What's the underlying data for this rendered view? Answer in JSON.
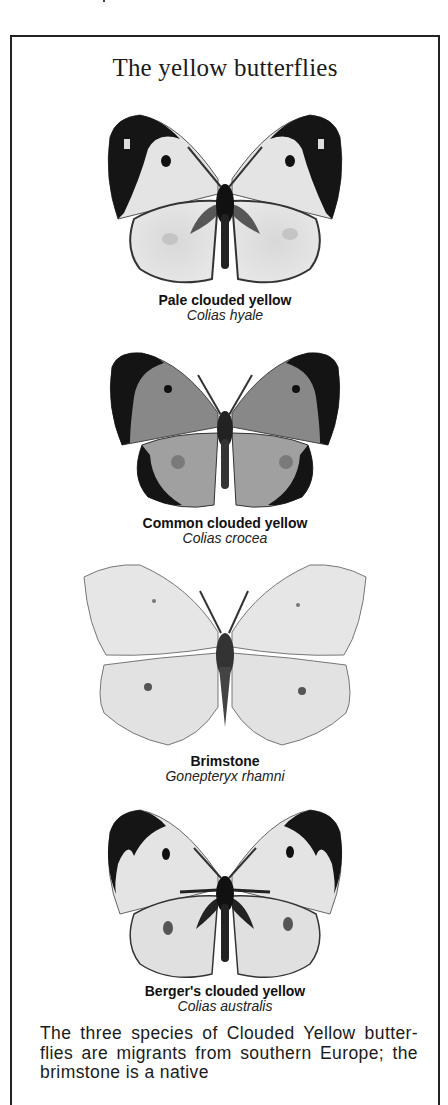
{
  "page": {
    "title": "The yellow butterflies"
  },
  "specimens": [
    {
      "common_name": "Pale clouded yellow",
      "latin_name": "Colias hyale",
      "icon": "butterfly-pale-clouded-yellow"
    },
    {
      "common_name": "Common clouded yellow",
      "latin_name": "Colias crocea",
      "icon": "butterfly-common-clouded-yellow"
    },
    {
      "common_name": "Brimstone",
      "latin_name": "Gonepteryx rhamni",
      "icon": "butterfly-brimstone"
    },
    {
      "common_name": "Berger's clouded yellow",
      "latin_name": "Colias australis",
      "icon": "butterfly-bergers-clouded-yellow"
    }
  ],
  "caption": {
    "text": "The three species of Clouded Yellow butter-flies are migrants from southern Europe; the brimstone is a native"
  }
}
